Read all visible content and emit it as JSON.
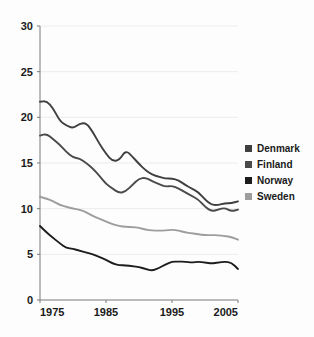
{
  "chart_data": {
    "type": "line",
    "title": "",
    "subtitle": "",
    "xlabel": "",
    "ylabel": "",
    "xlim": [
      1975,
      2005
    ],
    "ylim": [
      0,
      30
    ],
    "grid": true,
    "legend_position": "right",
    "x_ticks": [
      "1975",
      "1985",
      "1995",
      "2005"
    ],
    "x_tick_values": [
      1975,
      1985,
      1995,
      2005
    ],
    "y_ticks": [
      "0",
      "5",
      "10",
      "15",
      "20",
      "25",
      "30"
    ],
    "y_tick_values": [
      0,
      5,
      10,
      15,
      20,
      25,
      30
    ],
    "x": [
      1975,
      1976,
      1977,
      1978,
      1979,
      1980,
      1981,
      1982,
      1983,
      1984,
      1985,
      1986,
      1987,
      1988,
      1989,
      1990,
      1991,
      1992,
      1993,
      1994,
      1995,
      1996,
      1997,
      1998,
      1999,
      2000,
      2001,
      2002,
      2003,
      2004,
      2005
    ],
    "series": [
      {
        "name": "Denmark",
        "color": "#3f3f3f",
        "values": [
          21.7,
          21.8,
          21.0,
          19.6,
          19.1,
          18.8,
          19.3,
          19.4,
          18.4,
          17.1,
          16.0,
          15.2,
          15.3,
          16.4,
          15.7,
          14.9,
          14.2,
          13.7,
          13.5,
          13.3,
          13.3,
          13.1,
          12.6,
          12.2,
          11.8,
          11.0,
          10.4,
          10.4,
          10.6,
          10.6,
          10.8
        ]
      },
      {
        "name": "Finland",
        "color": "#4a4a4a",
        "values": [
          18.0,
          18.2,
          17.6,
          17.0,
          16.2,
          15.6,
          15.5,
          15.0,
          14.4,
          13.6,
          12.7,
          12.2,
          11.7,
          11.9,
          12.6,
          13.3,
          13.4,
          13.0,
          12.7,
          12.4,
          12.5,
          12.2,
          11.8,
          11.4,
          11.0,
          10.2,
          9.7,
          9.9,
          10.1,
          9.7,
          9.9
        ]
      },
      {
        "name": "Norway",
        "color": "#1c1c1c",
        "values": [
          8.1,
          7.4,
          6.8,
          6.2,
          5.7,
          5.6,
          5.4,
          5.2,
          5.0,
          4.7,
          4.4,
          4.0,
          3.8,
          3.8,
          3.7,
          3.6,
          3.4,
          3.2,
          3.5,
          3.9,
          4.2,
          4.2,
          4.2,
          4.1,
          4.2,
          4.1,
          4.0,
          4.1,
          4.2,
          4.1,
          3.4
        ]
      },
      {
        "name": "Sweden",
        "color": "#9d9d9d",
        "values": [
          11.3,
          11.1,
          10.8,
          10.4,
          10.2,
          10.0,
          9.9,
          9.6,
          9.2,
          8.9,
          8.6,
          8.3,
          8.1,
          8.0,
          8.0,
          7.9,
          7.7,
          7.6,
          7.6,
          7.6,
          7.7,
          7.6,
          7.4,
          7.3,
          7.2,
          7.1,
          7.1,
          7.1,
          7.0,
          6.9,
          6.6
        ]
      }
    ]
  },
  "legend": {
    "items": [
      {
        "label": "Denmark"
      },
      {
        "label": "Finland"
      },
      {
        "label": "Norway"
      },
      {
        "label": "Sweden"
      }
    ]
  },
  "axis": {
    "y_labels": [
      "30",
      "25",
      "20",
      "15",
      "10",
      "5",
      "0"
    ],
    "x_labels": [
      "1975",
      "1985",
      "1995",
      "2005"
    ]
  }
}
